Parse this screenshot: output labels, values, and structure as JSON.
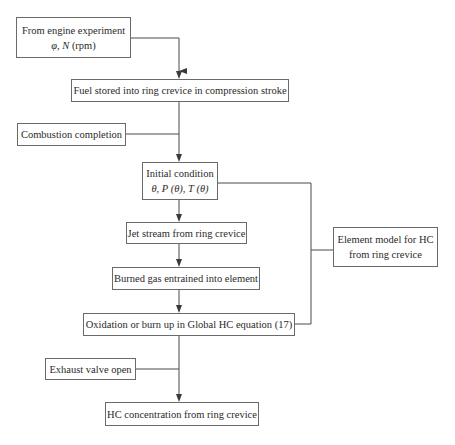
{
  "diagram": {
    "type": "flowchart",
    "nodes": [
      {
        "id": "engine_experiment",
        "line1": "From engine experiment",
        "line2_italic": "φ, N",
        "line2_plain": " (rpm)"
      },
      {
        "id": "fuel_stored",
        "label": "Fuel stored into ring crevice in compression stroke"
      },
      {
        "id": "combustion_completion",
        "label": "Combustion completion"
      },
      {
        "id": "initial_condition",
        "line1": "Initial condition",
        "line2": "θ, P (θ), T (θ)"
      },
      {
        "id": "jet_stream",
        "label": "Jet stream from ring crevice"
      },
      {
        "id": "burned_gas",
        "label": "Burned gas entrained into element"
      },
      {
        "id": "oxidation",
        "label": "Oxidation or burn up in Global HC equation (17)"
      },
      {
        "id": "exhaust_valve",
        "label": "Exhaust valve open"
      },
      {
        "id": "hc_concentration",
        "label": "HC concentration from ring crevice"
      },
      {
        "id": "element_model",
        "line1": "Element model for HC",
        "line2": "from ring crevice"
      }
    ],
    "edges": [
      {
        "from": "engine_experiment",
        "to": "fuel_stored",
        "arrow": true
      },
      {
        "from": "fuel_stored",
        "to": "initial_condition",
        "arrow": true
      },
      {
        "from": "combustion_completion",
        "to": "initial_condition",
        "arrow": false,
        "joins_main_line": true
      },
      {
        "from": "initial_condition",
        "to": "jet_stream",
        "arrow": true
      },
      {
        "from": "jet_stream",
        "to": "burned_gas",
        "arrow": true
      },
      {
        "from": "burned_gas",
        "to": "oxidation",
        "arrow": true
      },
      {
        "from": "oxidation",
        "to": "hc_concentration",
        "arrow": true
      },
      {
        "from": "exhaust_valve",
        "to": "hc_concentration",
        "arrow": false,
        "joins_main_line": true
      },
      {
        "from": "initial_condition",
        "to": "element_model",
        "arrow": false,
        "bracket": true
      },
      {
        "from": "oxidation",
        "to": "element_model",
        "arrow": false,
        "bracket": true
      }
    ]
  },
  "colors": {
    "line": "#4a4a4a",
    "border": "#6a6a6a",
    "text": "#2a2a2a",
    "background": "#ffffff"
  }
}
